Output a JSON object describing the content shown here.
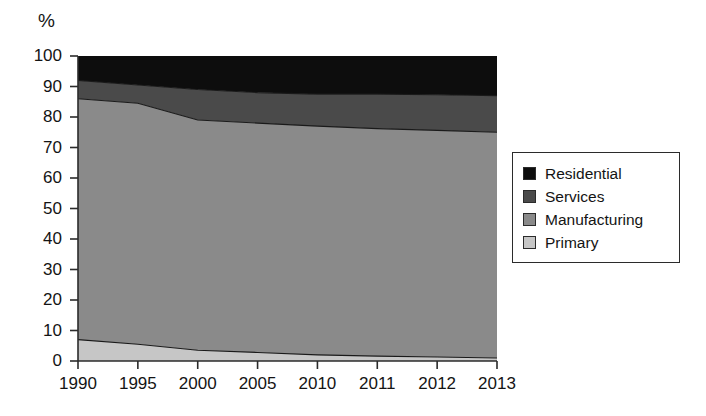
{
  "chart_data": {
    "type": "area",
    "subtype": "stacked-area-100pct",
    "title": "",
    "subtitle": "",
    "xlabel": "",
    "ylabel": "%",
    "unit_label": "%",
    "categories": [
      "1990",
      "1995",
      "2000",
      "2005",
      "2010",
      "2011",
      "2012",
      "2013"
    ],
    "x": [
      "1990",
      "1995",
      "2000",
      "2005",
      "2010",
      "2011",
      "2012",
      "2013"
    ],
    "xticklabels": [
      "1990",
      "1995",
      "2000",
      "2005",
      "2010",
      "2011",
      "2012",
      "2013"
    ],
    "yticklabels": [
      "0",
      "10",
      "20",
      "30",
      "40",
      "50",
      "60",
      "70",
      "80",
      "90",
      "100"
    ],
    "yticks": [
      0,
      10,
      20,
      30,
      40,
      50,
      60,
      70,
      80,
      90,
      100
    ],
    "ylim": [
      0,
      100
    ],
    "grid": false,
    "legend_position": "right",
    "stack_order_bottom_to_top": [
      "Primary",
      "Manufacturing",
      "Services",
      "Residential"
    ],
    "series": [
      {
        "name": "Primary",
        "color": "#c6c6c6",
        "values": [
          7.0,
          5.5,
          3.5,
          2.8,
          2.0,
          1.6,
          1.3,
          1.0
        ]
      },
      {
        "name": "Manufacturing",
        "color": "#8a8a8a",
        "values": [
          79.0,
          79.0,
          75.5,
          75.2,
          75.0,
          74.6,
          74.3,
          74.0
        ]
      },
      {
        "name": "Services",
        "color": "#4a4a4a",
        "values": [
          6.0,
          6.0,
          10.0,
          10.0,
          10.5,
          11.3,
          11.7,
          12.0
        ]
      },
      {
        "name": "Residential",
        "color": "#0d0d0d",
        "values": [
          8.0,
          9.5,
          11.0,
          12.0,
          12.5,
          12.5,
          12.7,
          13.0
        ]
      }
    ],
    "cumulative_tops": {
      "Primary": [
        7.0,
        5.5,
        3.5,
        2.8,
        2.0,
        1.6,
        1.3,
        1.0
      ],
      "Manufacturing": [
        86.0,
        84.5,
        79.0,
        78.0,
        77.0,
        76.2,
        75.6,
        75.0
      ],
      "Services": [
        92.0,
        90.5,
        89.0,
        88.0,
        87.5,
        87.5,
        87.3,
        87.0
      ],
      "Residential": [
        100,
        100,
        100,
        100,
        100,
        100,
        100,
        100
      ]
    }
  },
  "legend": {
    "items": [
      {
        "label": "Residential",
        "color": "#0d0d0d"
      },
      {
        "label": "Services",
        "color": "#4a4a4a"
      },
      {
        "label": "Manufacturing",
        "color": "#8a8a8a"
      },
      {
        "label": "Primary",
        "color": "#c6c6c6"
      }
    ]
  },
  "colors": {
    "residential": "#0d0d0d",
    "services": "#4a4a4a",
    "manufacturing": "#8a8a8a",
    "primary": "#c6c6c6",
    "axis": "#2b2b2b",
    "background": "#ffffff"
  }
}
